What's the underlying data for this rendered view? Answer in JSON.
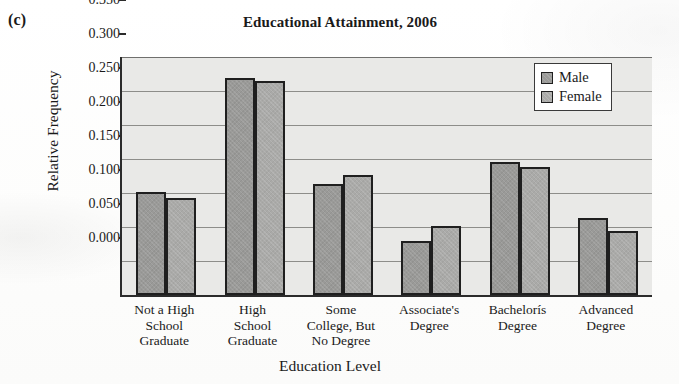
{
  "panel": {
    "label": "(c)"
  },
  "chart_data": {
    "type": "bar",
    "title": "Educational Attainment, 2006",
    "xlabel": "Education Level",
    "ylabel": "Relative Frequency",
    "ylim": [
      0.0,
      0.35
    ],
    "ytick_labels": [
      "0.350",
      "0.300",
      "0.250",
      "0.200",
      "0.150",
      "0.100",
      "0.050",
      "0.000"
    ],
    "ytick_values": [
      0.35,
      0.3,
      0.25,
      0.2,
      0.15,
      0.1,
      0.05,
      0.0
    ],
    "grid": true,
    "legend_position": "top-right",
    "categories": [
      "Not a High\nSchool\nGraduate",
      "High\nSchool\nGraduate",
      "Some\nCollege, But\nNo Degree",
      "Associate's\nDegree",
      "Bachelorís\nDegree",
      "Advanced\nDegree"
    ],
    "series": [
      {
        "name": "Male",
        "values": [
          0.152,
          0.319,
          0.163,
          0.079,
          0.196,
          0.113
        ]
      },
      {
        "name": "Female",
        "values": [
          0.143,
          0.315,
          0.176,
          0.101,
          0.188,
          0.094
        ]
      }
    ],
    "colors": {
      "male": "#9a9a98",
      "female": "#aaaaa8",
      "plot_background": "#e9e9e7",
      "axis": "#2b2b2b",
      "gridline": "#8d8d8a"
    }
  },
  "legend": {
    "items": [
      {
        "label": "Male"
      },
      {
        "label": "Female"
      }
    ]
  }
}
